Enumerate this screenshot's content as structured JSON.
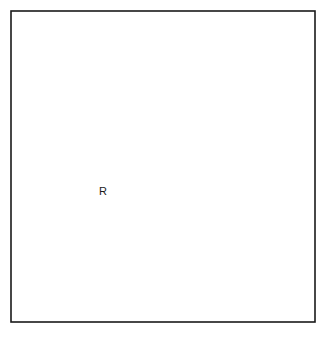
{
  "figure": {
    "kind": "contour-map",
    "title": "",
    "background_color": "#ffffff",
    "line_color": "#1a1a1a",
    "frame": {
      "x": 11,
      "y": 11,
      "width": 304,
      "height": 311,
      "stroke_width": 1.6
    },
    "labels": [
      {
        "name": "peak-label-R",
        "text": "R",
        "x": 103,
        "y": 192
      }
    ]
  },
  "chart_data": {
    "type": "line",
    "title": "",
    "xlabel": "",
    "ylabel": "",
    "grid": false,
    "legend": "none",
    "xlim": [
      11,
      315
    ],
    "ylim": [
      11,
      322
    ],
    "annotations": [
      {
        "text": "R",
        "x": 103,
        "y": 192,
        "note": "innermost ring label at left peak"
      }
    ],
    "series": [
      {
        "name": "innermost-ring-R",
        "closed": true,
        "kind": "closed-contour",
        "level": 5,
        "center": [
          104,
          192
        ],
        "path": "M 92 198 C 90 191, 94 185, 102 182 C 110 179, 118 181, 119 187 C 120 194, 114 200, 106 203 C 98 206, 93 204, 92 198 Z"
      },
      {
        "name": "middle-ring-left-peak",
        "closed": true,
        "kind": "closed-contour",
        "level": 4,
        "center": [
          107,
          192
        ],
        "path": "M 73 210 C 64 198, 70 177, 88 166 C 106 155, 128 156, 138 168 C 148 181, 141 202, 123 213 C 104 225, 82 222, 73 210 Z"
      },
      {
        "name": "outer-ring-left-peak",
        "closed": true,
        "kind": "closed-contour",
        "level": 3,
        "center": [
          110,
          192
        ],
        "path": "M 58 214 C 47 194, 58 163, 84 147 C 110 131, 143 133, 157 151 C 171 170, 160 202, 134 219 C 107 236, 70 234, 58 214 Z"
      },
      {
        "name": "small-ring-right-peak",
        "closed": true,
        "kind": "closed-contour",
        "level": 4,
        "center": [
          213,
          110
        ],
        "path": "M 195 122 C 191 113, 198 100, 211 94 C 224 88, 235 92, 236 100 C 237 110, 229 121, 216 127 C 204 132, 197 130, 195 122 Z"
      },
      {
        "name": "outer-peanut-contour",
        "closed": true,
        "kind": "closed-contour",
        "level": 2,
        "center": [
          150,
          160
        ],
        "path": "M 40 230 C 28 202, 42 156, 80 127 C 114 101, 150 94, 172 73 C 196 50, 228 47, 253 61 C 276 74, 283 101, 274 127 C 264 156, 236 172, 208 179 C 185 185, 170 196, 158 214 C 142 238, 120 256, 92 258 C 64 260, 48 250, 40 230 Z"
      },
      {
        "name": "open-contour-upper-left",
        "closed": false,
        "kind": "open-contour",
        "level": 1,
        "path": "M 155 11 C 127 32, 100 56, 76 82 C 56 104, 36 128, 12 152"
      },
      {
        "name": "open-contour-lower-right-inner",
        "closed": false,
        "kind": "open-contour",
        "level": 1,
        "path": "M 315 143 C 292 158, 272 176, 256 198 C 235 227, 206 259, 176 281 C 154 298, 132 312, 116 321"
      },
      {
        "name": "open-contour-lower-right-outer",
        "closed": false,
        "kind": "open-contour",
        "level": 0,
        "path": "M 315 215 C 297 232, 278 250, 260 268 C 246 282, 235 300, 229 321"
      },
      {
        "name": "open-contour-bottom-left",
        "closed": false,
        "kind": "open-contour",
        "level": 1,
        "path": "M 11 296 C 24 310, 38 319, 56 321 C 74 322, 92 316, 108 306"
      }
    ]
  }
}
